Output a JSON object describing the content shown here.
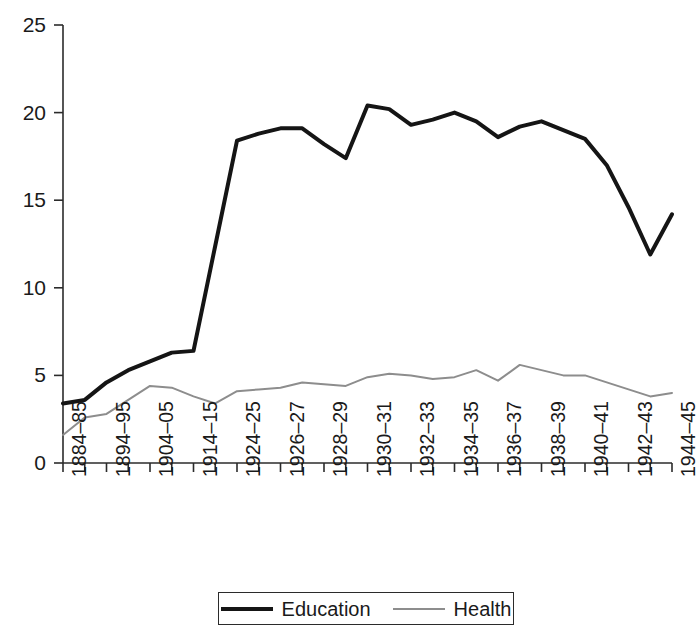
{
  "chart_data": {
    "type": "line",
    "title": "",
    "xlabel": "",
    "ylabel": "",
    "ylim": [
      0,
      25
    ],
    "yticks": [
      0,
      5,
      10,
      15,
      20,
      25
    ],
    "grid": false,
    "legend_position": "bottom-center",
    "x_tick_count": 29,
    "categories": [
      "1884–85",
      "",
      "1894–95",
      "",
      "1904–05",
      "",
      "1914–15",
      "",
      "1924–25",
      "",
      "1926–27",
      "",
      "1928–29",
      "",
      "1930–31",
      "",
      "1932–33",
      "",
      "1934–35",
      "",
      "1936–37",
      "",
      "1938–39",
      "",
      "1940–41",
      "",
      "1942–43",
      "",
      "1944–45"
    ],
    "visible_tick_labels": [
      "1884–85",
      "1894–95",
      "1904–05",
      "1914–15",
      "1924–25",
      "1926–27",
      "1928–29",
      "1930–31",
      "1932–33",
      "1934–35",
      "1936–37",
      "1938–39",
      "1940–41",
      "1942–43",
      "1944–45"
    ],
    "series": [
      {
        "name": "Education",
        "color": "#151515",
        "line_width": 4,
        "values": [
          3.4,
          3.6,
          4.6,
          5.3,
          5.8,
          6.3,
          6.4,
          12.4,
          18.4,
          18.8,
          19.1,
          19.1,
          18.2,
          17.4,
          20.4,
          20.2,
          19.3,
          19.6,
          20.0,
          19.5,
          18.6,
          19.2,
          19.5,
          19.0,
          18.5,
          17.0,
          14.6,
          11.9,
          14.2
        ]
      },
      {
        "name": "Health",
        "color": "#8d8d8d",
        "line_width": 2,
        "values": [
          1.6,
          2.6,
          2.8,
          3.6,
          4.4,
          4.3,
          3.8,
          3.4,
          4.1,
          4.2,
          4.3,
          4.6,
          4.5,
          4.4,
          4.9,
          5.1,
          5.0,
          4.8,
          4.9,
          5.3,
          4.7,
          5.6,
          5.3,
          5.0,
          5.0,
          4.6,
          4.2,
          3.8,
          4.0
        ]
      }
    ]
  },
  "legend": {
    "items": [
      {
        "label": "Education"
      },
      {
        "label": "Health"
      }
    ]
  },
  "axis": {
    "y_label_0": "0",
    "y_label_5": "5",
    "y_label_10": "10",
    "y_label_15": "15",
    "y_label_20": "20",
    "y_label_25": "25"
  }
}
